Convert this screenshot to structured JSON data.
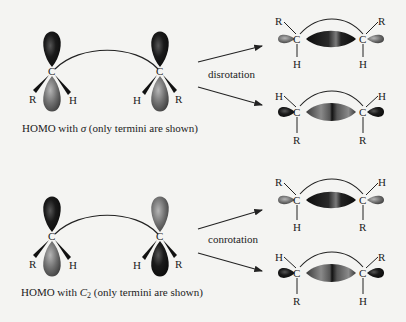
{
  "colors": {
    "background": "#f4f4f2",
    "lobe_dark": "#151515",
    "lobe_gray": "#6a6a6a",
    "line": "#222222"
  },
  "reactant_sigma": {
    "caption_prefix": "HOMO with ",
    "caption_symbol": "σ",
    "caption_suffix": " (only termini are shown)",
    "left_atom": {
      "center": "C",
      "sub_left": "R",
      "sub_right": "H",
      "top_lobe": "dark",
      "bottom_lobe": "gray"
    },
    "right_atom": {
      "center": "C",
      "sub_left": "H",
      "sub_right": "R",
      "top_lobe": "dark",
      "bottom_lobe": "gray"
    }
  },
  "reactant_c2": {
    "caption_prefix": "HOMO with ",
    "caption_symbol": "C",
    "caption_subscript": "2",
    "caption_suffix": " (only termini are shown)",
    "left_atom": {
      "center": "C",
      "sub_left": "R",
      "sub_right": "H",
      "top_lobe": "dark",
      "bottom_lobe": "gray"
    },
    "right_atom": {
      "center": "C",
      "sub_left": "H",
      "sub_right": "R",
      "top_lobe": "gray",
      "bottom_lobe": "dark"
    }
  },
  "arrows": {
    "disrotation_label": "disrotation",
    "conrotation_label": "conrotation"
  },
  "products": [
    {
      "id": "disrot-1",
      "left_top": "R",
      "left_bottom": "H",
      "right_top": "R",
      "right_bottom": "H",
      "atom": "C",
      "central_lobe": "dark",
      "end_lobes": "gray"
    },
    {
      "id": "disrot-2",
      "left_top": "H",
      "left_bottom": "R",
      "right_top": "H",
      "right_bottom": "R",
      "atom": "C",
      "central_lobe": "gray",
      "end_lobes": "dark"
    },
    {
      "id": "conrot-1",
      "left_top": "R",
      "left_bottom": "H",
      "right_top": "H",
      "right_bottom": "R",
      "atom": "C",
      "central_lobe": "dark",
      "end_lobes": "gray"
    },
    {
      "id": "conrot-2",
      "left_top": "H",
      "left_bottom": "R",
      "right_top": "R",
      "right_bottom": "H",
      "atom": "C",
      "central_lobe": "gray",
      "end_lobes": "dark"
    }
  ]
}
